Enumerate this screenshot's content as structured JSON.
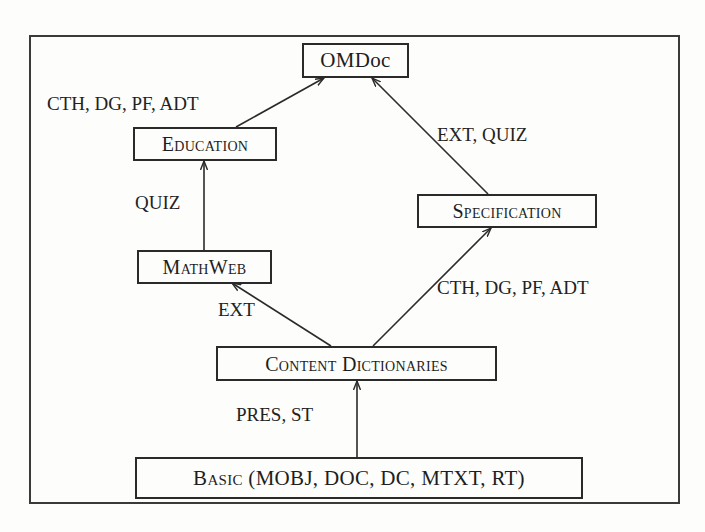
{
  "diagram": {
    "type": "module-dependency-graph",
    "nodes": [
      {
        "id": "omdoc",
        "label": "OMDoc",
        "small_caps": false
      },
      {
        "id": "education",
        "label": "Education",
        "small_caps": true
      },
      {
        "id": "specification",
        "label": "Specification",
        "small_caps": true
      },
      {
        "id": "mathweb",
        "label": "MathWeb",
        "small_caps": true
      },
      {
        "id": "content_dictionaries",
        "label": "Content Dictionaries",
        "small_caps": true
      },
      {
        "id": "basic",
        "label_sc": "Basic",
        "label_rest": " (MOBJ, DOC, DC, MTXT, RT)"
      }
    ],
    "edges": [
      {
        "from": "education",
        "to": "omdoc",
        "label": "CTH, DG, PF, ADT"
      },
      {
        "from": "specification",
        "to": "omdoc",
        "label": "EXT, QUIZ"
      },
      {
        "from": "mathweb",
        "to": "education",
        "label": "QUIZ"
      },
      {
        "from": "content_dictionaries",
        "to": "specification",
        "label": "CTH, DG, PF, ADT"
      },
      {
        "from": "content_dictionaries",
        "to": "mathweb",
        "label": "EXT"
      },
      {
        "from": "basic",
        "to": "content_dictionaries",
        "label": "PRES, ST"
      }
    ],
    "colors": {
      "line": "#2a2a2a",
      "background": "#fdfdfb",
      "text": "#1e1e1e"
    }
  }
}
